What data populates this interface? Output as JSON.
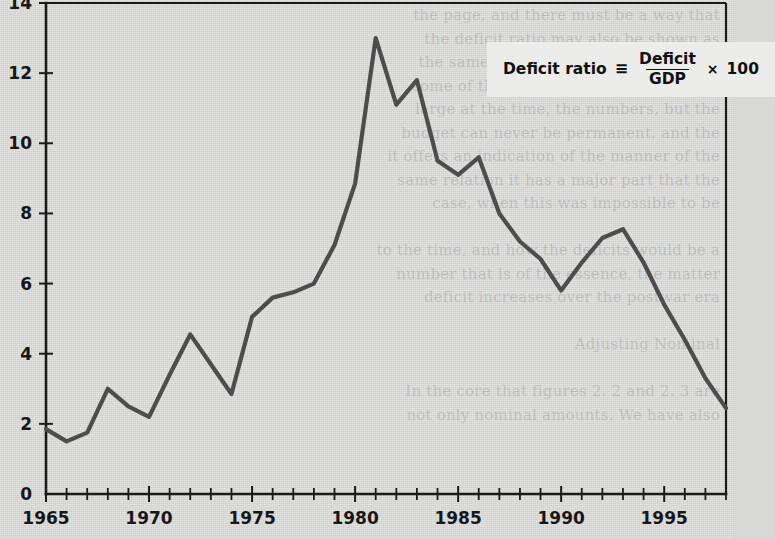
{
  "legend": {
    "label": "Deficit ratio",
    "identity_symbol": "≡",
    "numerator": "Deficit",
    "denominator": "GDP",
    "times_symbol": "×",
    "multiplier": "100"
  },
  "ghost_text": "the page, and there must be a way that\nthe deficit ratio may also be shown as\nthe same quantity. The problem is that\nsome of the numbers may have been so\nlarge at the time, the numbers, but the\nbudget can never be permanent, and the\nit offers an indication of the manner of the\nsame relation it has a major part that the\ncase, when this was impossible to be\n\nto the time, and how the deficits would be a\nnumber that is of the essence, the matter\ndeficit increases over the postwar era\n\nAdjusting Nominal\n\nIn the core that figures 2. 2 and 2. 3 are\nnot only nominal amounts. We have also",
  "chart_data": {
    "type": "line",
    "title": "",
    "xlabel": "",
    "ylabel": "",
    "xlim": [
      1965,
      1998
    ],
    "ylim": [
      0,
      14
    ],
    "ytick_values": [
      0,
      2,
      4,
      6,
      8,
      10,
      12,
      14
    ],
    "ytick_labels": [
      "0",
      "2",
      "4",
      "6",
      "8",
      "10",
      "12",
      "14"
    ],
    "xtick_values": [
      1965,
      1970,
      1975,
      1980,
      1985,
      1990,
      1995
    ],
    "xtick_labels": [
      "1965",
      "1970",
      "1975",
      "1980",
      "1985",
      "1990",
      "1995"
    ],
    "x_minor_tick_step": 1,
    "grid": false,
    "legend_position": "upper-right",
    "line_color": "#4d4d4d",
    "axis_color": "#1b1b1b",
    "background_color": "#d9d9d7",
    "series": [
      {
        "name": "Deficit ratio",
        "x": [
          1965,
          1966,
          1967,
          1968,
          1969,
          1970,
          1971,
          1972,
          1973,
          1974,
          1975,
          1976,
          1977,
          1978,
          1979,
          1980,
          1981,
          1982,
          1983,
          1984,
          1985,
          1986,
          1987,
          1988,
          1989,
          1990,
          1991,
          1992,
          1993,
          1994,
          1995,
          1996,
          1997,
          1998
        ],
        "values": [
          1.85,
          1.5,
          1.75,
          3.0,
          2.5,
          2.2,
          3.4,
          4.55,
          3.7,
          2.85,
          5.05,
          5.6,
          5.75,
          6.0,
          7.1,
          8.85,
          13.0,
          11.1,
          11.8,
          9.5,
          9.1,
          9.6,
          8.0,
          7.2,
          6.7,
          5.8,
          6.6,
          7.3,
          7.55,
          6.6,
          5.4,
          4.4,
          3.3,
          2.45
        ]
      }
    ]
  }
}
